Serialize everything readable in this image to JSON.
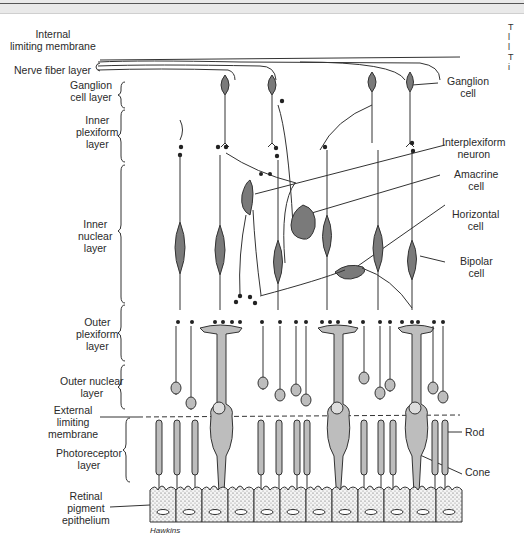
{
  "figure": {
    "signature": "Hawkins",
    "colors": {
      "neuron_fill": "#7a7a7a",
      "photoreceptor_fill": "#bdbdbd",
      "line": "#333333",
      "background": "#ffffff"
    }
  },
  "left_labels": [
    {
      "id": "internal-limiting-membrane",
      "text": "Internal\nlimiting membrane"
    },
    {
      "id": "nerve-fiber-layer",
      "text": "Nerve fiber layer"
    },
    {
      "id": "ganglion-cell-layer",
      "text": "Ganglion\ncell layer"
    },
    {
      "id": "inner-plexiform-layer",
      "text": "Inner\nplexiform\nlayer"
    },
    {
      "id": "inner-nuclear-layer",
      "text": "Inner\nnuclear\nlayer"
    },
    {
      "id": "outer-plexiform-layer",
      "text": "Outer\nplexiform\nlayer"
    },
    {
      "id": "outer-nuclear-layer",
      "text": "Outer nuclear\nlayer"
    },
    {
      "id": "external-limiting-membrane",
      "text": "External\nlimiting\nmembrane"
    },
    {
      "id": "photoreceptor-layer",
      "text": "Photoreceptor\nlayer"
    },
    {
      "id": "retinal-pigment-epithelium",
      "text": "Retinal\npigment\nepithelium"
    }
  ],
  "right_labels": [
    {
      "id": "ganglion-cell",
      "text": "Ganglion\ncell"
    },
    {
      "id": "interplexiform-neuron",
      "text": "Interplexiform\nneuron"
    },
    {
      "id": "amacrine-cell",
      "text": "Amacrine\ncell"
    },
    {
      "id": "horizontal-cell",
      "text": "Horizontal\ncell"
    },
    {
      "id": "bipolar-cell",
      "text": "Bipolar\ncell"
    },
    {
      "id": "rod",
      "text": "Rod"
    },
    {
      "id": "cone",
      "text": "Cone"
    }
  ],
  "edge_fragment": "T\nl\nl\nT\ni"
}
